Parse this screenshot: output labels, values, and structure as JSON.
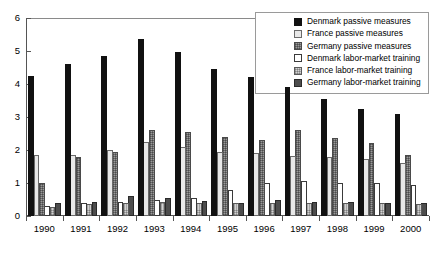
{
  "chart_data": {
    "type": "bar",
    "title": "",
    "xlabel": "",
    "ylabel": "",
    "ylim": [
      0,
      6
    ],
    "ytick_labels": [
      "0",
      "1",
      "2",
      "3",
      "4",
      "5",
      "6"
    ],
    "ytick_values": [
      0,
      1,
      2,
      3,
      4,
      5,
      6
    ],
    "grid": false,
    "legend_position": "top-right",
    "categories": [
      "1990",
      "1991",
      "1992",
      "1993",
      "1994",
      "1995",
      "1996",
      "1997",
      "1998",
      "1999",
      "2000"
    ],
    "series": [
      {
        "name": "Denmark passive measures",
        "color": "#111111",
        "swatch": "solid-black",
        "values": [
          4.25,
          4.6,
          4.85,
          5.35,
          4.98,
          4.45,
          4.2,
          3.9,
          3.55,
          3.25,
          3.1
        ]
      },
      {
        "name": "France passive measures",
        "color": "#e8e8e8",
        "swatch": "solid-very-light",
        "values": [
          1.85,
          1.85,
          2.0,
          2.25,
          2.1,
          1.95,
          1.9,
          1.82,
          1.78,
          1.72,
          1.62
        ]
      },
      {
        "name": "Germany passive measures",
        "color": "#9a9a9a",
        "swatch": "mid-grey-mesh",
        "values": [
          1.0,
          1.78,
          1.95,
          2.6,
          2.55,
          2.4,
          2.3,
          2.6,
          2.35,
          2.2,
          1.85
        ]
      },
      {
        "name": "Denmark labor-market training",
        "color": "#ffffff",
        "swatch": "white-outline",
        "values": [
          0.3,
          0.38,
          0.42,
          0.48,
          0.55,
          0.78,
          1.0,
          1.05,
          1.0,
          1.0,
          0.95
        ]
      },
      {
        "name": "France labor-market training",
        "color": "#d2d2d2",
        "swatch": "light-mesh",
        "values": [
          0.28,
          0.36,
          0.38,
          0.42,
          0.4,
          0.38,
          0.38,
          0.38,
          0.38,
          0.38,
          0.36
        ]
      },
      {
        "name": "Germany labor-market training",
        "color": "#4d4d4d",
        "swatch": "dark-grey",
        "values": [
          0.38,
          0.42,
          0.62,
          0.55,
          0.45,
          0.4,
          0.48,
          0.42,
          0.42,
          0.4,
          0.4
        ]
      }
    ]
  }
}
